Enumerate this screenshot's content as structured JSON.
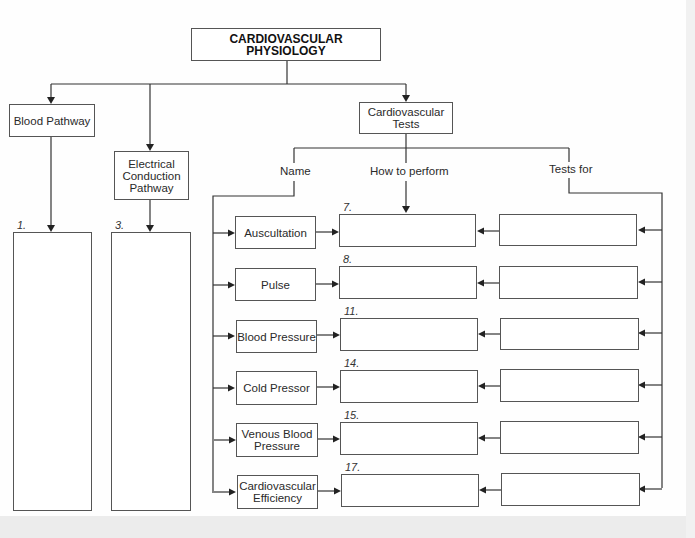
{
  "title": "CARDIOVASCULAR PHYSIOLOGY",
  "branches": {
    "blood_pathway": "Blood Pathway",
    "electrical_line1": "Electrical",
    "electrical_line2": "Conduction",
    "electrical_line3": "Pathway",
    "tests_line1": "Cardiovascular",
    "tests_line2": "Tests"
  },
  "blank_labels": {
    "blood_pathway": "1.",
    "electrical": "3."
  },
  "columns": {
    "name": "Name",
    "how": "How to perform",
    "tests_for": "Tests for"
  },
  "rows": [
    {
      "name_line1": "Auscultation",
      "name_line2": "",
      "how_number": "7."
    },
    {
      "name_line1": "Pulse",
      "name_line2": "",
      "how_number": "8."
    },
    {
      "name_line1": "Blood Pressure",
      "name_line2": "",
      "how_number": "11."
    },
    {
      "name_line1": "Cold Pressor",
      "name_line2": "",
      "how_number": "14."
    },
    {
      "name_line1": "Venous Blood",
      "name_line2": "Pressure",
      "how_number": "15."
    },
    {
      "name_line1": "Cardiovascular",
      "name_line2": "Efficiency",
      "how_number": "17."
    }
  ]
}
